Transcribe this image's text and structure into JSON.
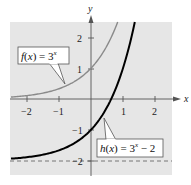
{
  "chart_data": {
    "type": "line",
    "title": "",
    "xlabel": "x",
    "ylabel": "y",
    "xlim": [
      -2.5,
      2.5
    ],
    "ylim": [
      -2.4,
      2.5
    ],
    "grid": false,
    "x_ticks": [
      -2,
      -1,
      1,
      2
    ],
    "x_tick_labels": [
      "−2",
      "−1",
      "1",
      "2"
    ],
    "y_ticks": [
      2,
      1,
      -1,
      -2
    ],
    "y_tick_labels": [
      "2",
      "1",
      "−1",
      "−2"
    ],
    "series": [
      {
        "name": "f(x) = 3^x",
        "label_main": "f(x) = 3",
        "label_sup": "x",
        "color": "#8a8a8a",
        "x": [
          -2.5,
          -2,
          -1.5,
          -1,
          -0.5,
          0,
          0.25,
          0.5,
          0.75,
          0.834
        ],
        "y": [
          0.064,
          0.111,
          0.192,
          0.333,
          0.577,
          1,
          1.316,
          1.732,
          2.28,
          2.5
        ]
      },
      {
        "name": "h(x) = 3^x − 2",
        "label_main": "h(x) = 3",
        "label_sup": "x",
        "label_tail": " − 2",
        "color": "#000000",
        "x": [
          -2.5,
          -2,
          -1.5,
          -1,
          -0.5,
          0,
          0.25,
          0.5,
          0.631,
          0.75,
          1,
          1.25,
          1.369
        ],
        "y": [
          -1.936,
          -1.889,
          -1.808,
          -1.667,
          -1.423,
          -1,
          -0.684,
          -0.268,
          0,
          0.28,
          1,
          1.948,
          2.5
        ]
      }
    ],
    "annotations": [
      {
        "type": "asymptote",
        "orientation": "horizontal",
        "y": -2,
        "style": "dashed",
        "color": "#666666"
      },
      {
        "type": "point",
        "x": 0,
        "y": 1,
        "series": "f(x) = 3^x"
      }
    ],
    "colors": {
      "plot_background": "#e6e6e6",
      "axis": "#555555",
      "f_curve": "#8a8a8a",
      "h_curve": "#000000"
    }
  }
}
